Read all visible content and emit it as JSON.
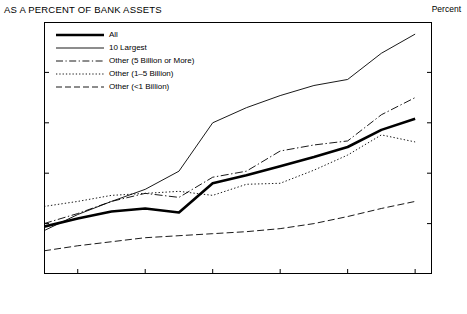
{
  "title": "AS A PERCENT OF BANK ASSETS",
  "unit_label": "Percent",
  "chart_data": {
    "type": "line",
    "title": "AS A PERCENT OF BANK ASSETS",
    "xlabel": "",
    "ylabel": "Percent",
    "ylim": [
      0.5,
      3
    ],
    "xlim": [
      1982,
      1993.5
    ],
    "grid": false,
    "legend_position": "top-left",
    "yticks": [
      "0.5",
      "1",
      "1.5",
      "2",
      "2.5",
      "3"
    ],
    "ytick_values": [
      0.5,
      1,
      1.5,
      2,
      2.5,
      3
    ],
    "xticks": [
      "1983",
      "1985",
      "1987",
      "1989",
      "1991",
      "1993"
    ],
    "xtick_values": [
      1983,
      1985,
      1987,
      1989,
      1991,
      1993
    ],
    "x": [
      1982,
      1983,
      1984,
      1985,
      1986,
      1987,
      1988,
      1989,
      1990,
      1991,
      1992,
      1993
    ],
    "series": [
      {
        "name": "All",
        "style": "solid-thick",
        "values": [
          0.97,
          1.05,
          1.12,
          1.15,
          1.11,
          1.4,
          1.48,
          1.57,
          1.66,
          1.76,
          1.93,
          2.04
        ]
      },
      {
        "name": "10 Largest",
        "style": "solid-thin",
        "values": [
          0.93,
          1.09,
          1.22,
          1.34,
          1.52,
          2.0,
          2.15,
          2.27,
          2.37,
          2.43,
          2.69,
          2.88
        ]
      },
      {
        "name": "Other (5 Billion or More)",
        "style": "dash-dot",
        "values": [
          1.0,
          1.1,
          1.22,
          1.3,
          1.26,
          1.46,
          1.52,
          1.72,
          1.78,
          1.82,
          2.08,
          2.25
        ]
      },
      {
        "name": "Other (1–5 Billion)",
        "style": "dotted",
        "values": [
          1.17,
          1.22,
          1.28,
          1.3,
          1.32,
          1.28,
          1.39,
          1.4,
          1.53,
          1.68,
          1.88,
          1.81
        ]
      },
      {
        "name": "Other (<1 Billion)",
        "style": "dashed",
        "values": [
          0.73,
          0.78,
          0.82,
          0.86,
          0.88,
          0.9,
          0.92,
          0.95,
          1.0,
          1.07,
          1.15,
          1.22
        ]
      }
    ]
  },
  "legend": [
    {
      "label": "All",
      "style": "solid-thick"
    },
    {
      "label": "10 Largest",
      "style": "solid-thin"
    },
    {
      "label": "Other (5 Billion or More)",
      "style": "dash-dot"
    },
    {
      "label": "Other (1–5 Billion)",
      "style": "dotted"
    },
    {
      "label": "Other (<1 Billion)",
      "style": "dashed"
    }
  ]
}
